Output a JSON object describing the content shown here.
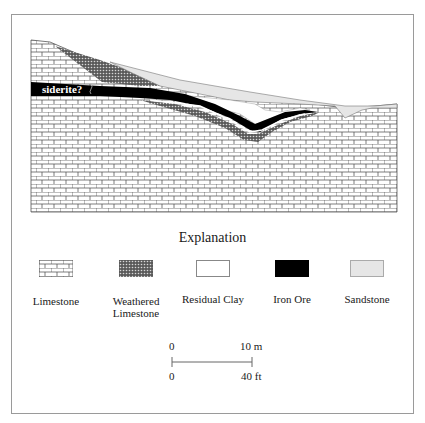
{
  "figure": {
    "annotation": "siderite?",
    "explanation_title": "Explanation",
    "legend": [
      {
        "id": "limestone",
        "label": "Limestone",
        "pattern": "brick"
      },
      {
        "id": "weathered-limestone",
        "label": "Weathered Limestone",
        "label_lines": [
          "Weathered",
          "Limestone"
        ],
        "pattern": "dotted-dark"
      },
      {
        "id": "residual-clay",
        "label": "Residual Clay",
        "pattern": "white",
        "color": "#ffffff"
      },
      {
        "id": "iron-ore",
        "label": "Iron Ore",
        "pattern": "solid",
        "color": "#000000"
      },
      {
        "id": "sandstone",
        "label": "Sandstone",
        "pattern": "light-gray",
        "color": "#e6e6e6"
      }
    ],
    "scale_bar": {
      "metric_start": "0",
      "metric_end": "10 m",
      "imperial_start": "0",
      "imperial_end": "40 ft"
    }
  }
}
